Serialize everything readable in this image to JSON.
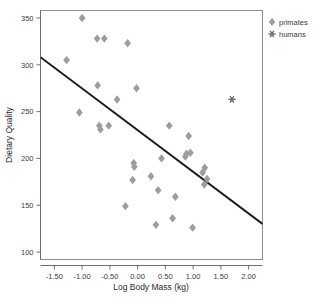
{
  "chart_data": {
    "type": "scatter",
    "title": "",
    "xlabel": "Log Body Mass (kg)",
    "ylabel": "Dietary Quality",
    "xlim": [
      -1.75,
      2.25
    ],
    "ylim": [
      92,
      358
    ],
    "xticks": [
      -1.5,
      -1.0,
      -0.5,
      0.0,
      0.5,
      1.0,
      1.5,
      2.0
    ],
    "xtick_labels": [
      "-1.50",
      "-1.00",
      "-0.50",
      "0.00",
      "0.50",
      "1.00",
      "1.50",
      "2.00"
    ],
    "yticks": [
      100,
      150,
      200,
      250,
      300,
      350
    ],
    "ytick_labels": [
      "100",
      "150",
      "200",
      "250",
      "300",
      "350"
    ],
    "grid": false,
    "legend_position": "top-right-outside",
    "series": [
      {
        "name": "primates",
        "marker": "diamond",
        "color": "#9d9d9d",
        "points": [
          [
            -1.0,
            350
          ],
          [
            -1.28,
            305
          ],
          [
            -0.73,
            328
          ],
          [
            -0.6,
            328
          ],
          [
            -0.18,
            323
          ],
          [
            -0.72,
            278
          ],
          [
            -0.02,
            275
          ],
          [
            -0.37,
            263
          ],
          [
            -1.05,
            249
          ],
          [
            -0.69,
            235
          ],
          [
            -0.67,
            231
          ],
          [
            -0.52,
            235
          ],
          [
            0.57,
            235
          ],
          [
            0.92,
            224
          ],
          [
            0.86,
            202
          ],
          [
            0.88,
            205
          ],
          [
            0.95,
            206
          ],
          [
            0.43,
            200
          ],
          [
            -0.07,
            195
          ],
          [
            -0.06,
            191
          ],
          [
            1.21,
            190
          ],
          [
            1.17,
            185
          ],
          [
            1.25,
            178
          ],
          [
            1.2,
            172
          ],
          [
            -0.09,
            177
          ],
          [
            0.24,
            181
          ],
          [
            0.37,
            166
          ],
          [
            0.68,
            159
          ],
          [
            -0.22,
            149
          ],
          [
            0.63,
            136
          ],
          [
            0.33,
            129
          ],
          [
            0.99,
            126
          ]
        ]
      },
      {
        "name": "humans",
        "marker": "star",
        "color": "#6a6a6a",
        "points": [
          [
            1.7,
            263
          ]
        ]
      }
    ],
    "fit_line": {
      "name": "regression-line",
      "color": "#1a1a1a",
      "x_start": -1.75,
      "y_start": 308,
      "x_end": 2.25,
      "y_end": 130
    }
  },
  "legend": {
    "items": [
      {
        "label": "primates",
        "marker": "diamond"
      },
      {
        "label": "humans",
        "marker": "star"
      }
    ]
  }
}
